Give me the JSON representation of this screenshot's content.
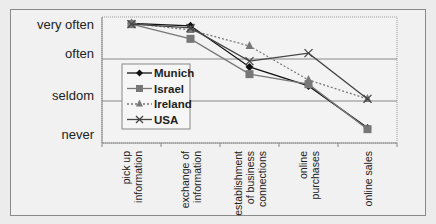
{
  "chart_data": {
    "type": "line",
    "title": "",
    "xlabel": "",
    "ylabel": "",
    "categories": [
      "pick up information",
      "exchange of information",
      "establishment of business connections",
      "online purchases",
      "online sales"
    ],
    "category_lines": [
      [
        "pick up",
        "information"
      ],
      [
        "exchange of",
        "information"
      ],
      [
        "establishment",
        "of business",
        "connections"
      ],
      [
        "online",
        "purchases"
      ],
      [
        "online sales"
      ]
    ],
    "y_ticks": [
      {
        "value": 4,
        "label": "very often"
      },
      {
        "value": 3,
        "label": "often"
      },
      {
        "value": 2,
        "label": "seldom"
      },
      {
        "value": 1,
        "label": "never"
      }
    ],
    "ylim": [
      1,
      4
    ],
    "grid": {
      "horizontal": [
        2,
        3
      ]
    },
    "legend_position": "inside-left",
    "series": [
      {
        "name": "Munich",
        "marker": "diamond",
        "dash": "solid",
        "color": "#111111",
        "values": [
          3.85,
          3.79,
          2.81,
          2.36,
          1.36
        ]
      },
      {
        "name": "Israel",
        "marker": "square",
        "dash": "solid",
        "color": "#777777",
        "values": [
          3.83,
          3.48,
          2.64,
          2.4,
          1.33
        ]
      },
      {
        "name": "Ireland",
        "marker": "triangle",
        "dash": "dotted",
        "color": "#777777",
        "values": [
          3.85,
          3.69,
          3.31,
          2.5,
          2.05
        ]
      },
      {
        "name": "USA",
        "marker": "x",
        "dash": "solid",
        "color": "#444444",
        "values": [
          3.83,
          3.74,
          2.95,
          3.14,
          2.05
        ]
      }
    ]
  }
}
